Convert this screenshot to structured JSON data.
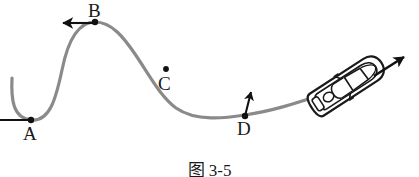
{
  "figure": {
    "caption": "图 3-5",
    "background_color": "#ffffff",
    "track": {
      "name": "roller-coaster-track",
      "color": "#8a8a8a",
      "stroke_width": 3.2,
      "description": "S-shaped curved track from valley A up over crest B down through C to valley D then rising to the car"
    },
    "points": [
      {
        "id": "A",
        "label": "A",
        "x": 31,
        "y": 120,
        "label_x": 23,
        "label_y": 124,
        "marker": "dot",
        "arrow": {
          "name": "acceleration-arrow-a",
          "direction": "up",
          "from_x": 31,
          "from_y": 120,
          "to_x": 31,
          "to_y": 9,
          "color": "#111111"
        }
      },
      {
        "id": "B",
        "label": "B",
        "x": 95,
        "y": 22,
        "label_x": 88,
        "label_y": 1,
        "marker": "dot",
        "arrow": {
          "name": "acceleration-arrow-b",
          "direction": "down",
          "from_x": 95,
          "from_y": 22,
          "to_x": 95,
          "to_y": 60,
          "color": "#111111"
        }
      },
      {
        "id": "C",
        "label": "C",
        "x": 166,
        "y": 69,
        "label_x": 158,
        "label_y": 76,
        "marker": "dot",
        "arrow": null
      },
      {
        "id": "D",
        "label": "D",
        "x": 245,
        "y": 115,
        "label_x": 237,
        "label_y": 119,
        "marker": "dot",
        "arrow": {
          "name": "acceleration-arrow-d",
          "direction": "up",
          "from_x": 246,
          "from_y": 116,
          "to_x": 252,
          "to_y": 88,
          "color": "#111111"
        }
      }
    ],
    "car": {
      "name": "car",
      "center_x": 347,
      "center_y": 85,
      "rotation_deg": -33,
      "outline_color": "#1a1a1a",
      "body_fill": "#ffffff",
      "description": "top-down view of a sports car on the track"
    },
    "velocity_arrow": {
      "name": "velocity-arrow",
      "from_x": 374,
      "from_y": 76,
      "to_x": 408,
      "to_y": 54,
      "color": "#111111",
      "direction": "up-right"
    }
  }
}
